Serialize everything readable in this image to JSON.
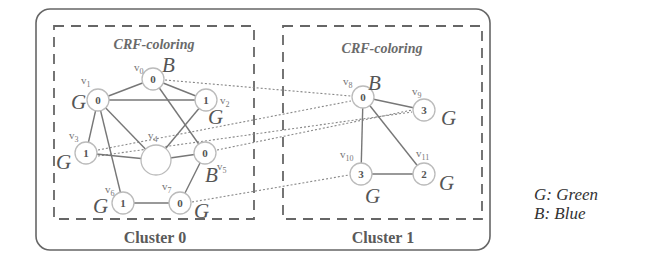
{
  "legend": {
    "g": "G: Green",
    "b": "B: Blue"
  },
  "clusters": [
    {
      "title": "CRF-coloring",
      "label": "Cluster 0"
    },
    {
      "title": "CRF-coloring",
      "label": "Cluster 1"
    }
  ],
  "nodes": {
    "v0": {
      "name": "v",
      "sub": "0",
      "value": "0",
      "color": "B"
    },
    "v1": {
      "name": "v",
      "sub": "1",
      "value": "0",
      "color": "G"
    },
    "v2": {
      "name": "v",
      "sub": "2",
      "value": "1",
      "color": "G"
    },
    "v3": {
      "name": "v",
      "sub": "3",
      "value": "1",
      "color": "G"
    },
    "v4": {
      "name": "v",
      "sub": "4",
      "value": "",
      "color": ""
    },
    "v5": {
      "name": "v",
      "sub": "5",
      "value": "0",
      "color": "B"
    },
    "v6": {
      "name": "v",
      "sub": "6",
      "value": "1",
      "color": "G"
    },
    "v7": {
      "name": "v",
      "sub": "7",
      "value": "0",
      "color": "G"
    },
    "v8": {
      "name": "v",
      "sub": "8",
      "value": "0",
      "color": "B"
    },
    "v9": {
      "name": "v",
      "sub": "9",
      "value": "3",
      "color": "G"
    },
    "v10": {
      "name": "v",
      "sub": "10",
      "value": "3",
      "color": "G"
    },
    "v11": {
      "name": "v",
      "sub": "11",
      "value": "2",
      "color": "G"
    }
  },
  "edges_solid": [
    [
      "v0",
      "v1"
    ],
    [
      "v0",
      "v2"
    ],
    [
      "v0",
      "v5"
    ],
    [
      "v1",
      "v2"
    ],
    [
      "v1",
      "v3"
    ],
    [
      "v1",
      "v4"
    ],
    [
      "v1",
      "v6"
    ],
    [
      "v2",
      "v4"
    ],
    [
      "v3",
      "v4"
    ],
    [
      "v4",
      "v5"
    ],
    [
      "v5",
      "v7"
    ],
    [
      "v6",
      "v7"
    ],
    [
      "v8",
      "v9"
    ],
    [
      "v8",
      "v10"
    ],
    [
      "v8",
      "v11"
    ],
    [
      "v10",
      "v11"
    ]
  ],
  "edges_dotted": [
    [
      "v0",
      "v8"
    ],
    [
      "v3",
      "v8"
    ],
    [
      "v3",
      "v9"
    ],
    [
      "v5",
      "v9"
    ],
    [
      "v7",
      "v10"
    ]
  ]
}
